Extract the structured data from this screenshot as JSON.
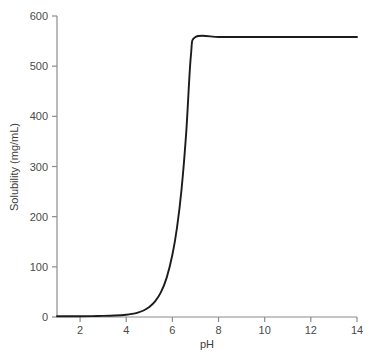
{
  "chart_data": {
    "type": "line",
    "title": "",
    "xlabel": "pH",
    "ylabel": "Solubility (mg/mL)",
    "xlim": [
      1,
      14
    ],
    "ylim": [
      0,
      600
    ],
    "xticks": [
      2,
      4,
      6,
      8,
      10,
      12,
      14
    ],
    "yticks": [
      0,
      100,
      200,
      300,
      400,
      500,
      600
    ],
    "xtick_labels": [
      "2",
      "4",
      "6",
      "8",
      "10",
      "12",
      "14"
    ],
    "ytick_labels": [
      "0",
      "100",
      "200",
      "300",
      "400",
      "500",
      "600"
    ],
    "grid": false,
    "legend": false,
    "series": [
      {
        "name": "Solubility vs pH",
        "color": "#1c1c1c",
        "plateau_value": 558,
        "plateau_start_ph": 6.8,
        "x": [
          1.0,
          1.5,
          2.0,
          2.5,
          3.0,
          3.5,
          4.0,
          4.25,
          4.5,
          4.75,
          5.0,
          5.25,
          5.5,
          5.75,
          6.0,
          6.2,
          6.4,
          6.6,
          6.8,
          7.0,
          8.0,
          9.0,
          10.0,
          11.0,
          12.0,
          13.0,
          14.0
        ],
        "y": [
          1.4,
          1.5,
          1.6,
          1.8,
          2.2,
          3.0,
          4.6,
          6.2,
          8.8,
          13.0,
          20.0,
          31.0,
          49.0,
          78.0,
          124.0,
          178.0,
          256.0,
          368.0,
          520.0,
          558.0,
          558.0,
          558.0,
          558.0,
          558.0,
          558.0,
          558.0,
          558.0
        ]
      }
    ],
    "axis_color": "#8c8c8c",
    "curve_color": "#1c1c1c",
    "background": "#ffffff"
  },
  "axes": {
    "x_axis_name": "pH",
    "y_axis_name": "Solubility (mg/mL)"
  }
}
